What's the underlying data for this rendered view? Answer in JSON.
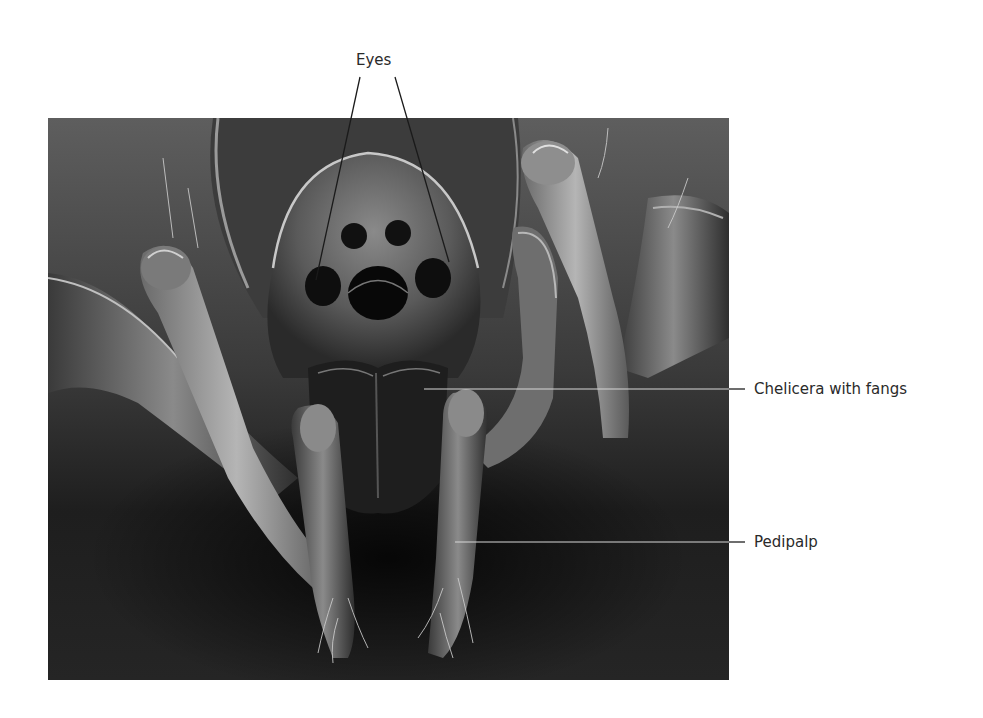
{
  "figure": {
    "labels": {
      "eyes": "Eyes",
      "chelicera": "Chelicera with fangs",
      "pedipalp": "Pedipalp"
    },
    "colors": {
      "background": "#ffffff",
      "label_text": "#2a2a2a",
      "leader_line": "#1a1a1a",
      "photo_bg_top": "#5a5a5a",
      "photo_bg_bottom": "#1c1c1c"
    }
  }
}
